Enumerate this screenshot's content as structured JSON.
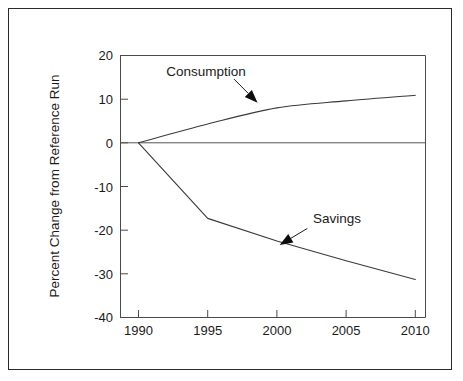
{
  "chart_data": {
    "type": "line",
    "title": "",
    "xlabel": "",
    "ylabel": "Percent Change from Reference Run",
    "x": [
      1990,
      1995,
      2000,
      2005,
      2010
    ],
    "xtick_labels": [
      "1990",
      "1995",
      "2000",
      "2005",
      "2010"
    ],
    "ytick_labels": [
      "20",
      "10",
      "0",
      "-10",
      "-20",
      "-30",
      "-40"
    ],
    "ytick_values": [
      20,
      10,
      0,
      -10,
      -20,
      -30,
      -40
    ],
    "xlim": [
      1990,
      2010
    ],
    "ylim": [
      -40,
      20
    ],
    "grid": false,
    "legend_position": "inline-annotations",
    "zero_line": true,
    "series": [
      {
        "name": "Consumption",
        "values": [
          0,
          4.3,
          8.0,
          9.6,
          10.9
        ],
        "annotation": {
          "label": "Consumption",
          "label_x": 1992.0,
          "label_y": 15.2,
          "arrow_from_x": 1996.9,
          "arrow_from_y": 14.6,
          "arrow_to_x": 1998.6,
          "arrow_to_y": 9.2
        }
      },
      {
        "name": "Savings",
        "values": [
          0,
          -17.3,
          -22.5,
          -27.0,
          -31.3
        ],
        "annotation": {
          "label": "Savings",
          "label_x": 2002.6,
          "label_y": -18.4,
          "arrow_from_x": 2002.2,
          "arrow_from_y": -19.6,
          "arrow_to_x": 2000.2,
          "arrow_to_y": -23.4
        }
      }
    ]
  },
  "axis": {
    "y_title": "Percent Change from Reference Run"
  },
  "labels": {
    "consumption": "Consumption",
    "savings": "Savings"
  },
  "ticks": {
    "x": [
      "1990",
      "1995",
      "2000",
      "2005",
      "2010"
    ],
    "y": [
      "20",
      "10",
      "0",
      "-10",
      "-20",
      "-30",
      "-40"
    ]
  },
  "colors": {
    "frame": "#2b2b2b",
    "axis": "#4a4a4a",
    "line": "#3a3a3a",
    "text": "#1a1a1a",
    "background": "#ffffff"
  }
}
